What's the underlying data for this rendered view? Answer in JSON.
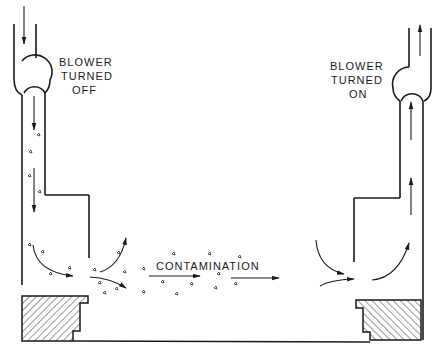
{
  "diagram": {
    "type": "airflow schematic",
    "labels": {
      "left_blower": [
        "BLOWER",
        "TURNED",
        "OFF"
      ],
      "right_blower": [
        "BLOWER",
        "TURNED",
        "ON"
      ],
      "flow": "CONTAMINATION"
    },
    "components": [
      {
        "name": "left-duct",
        "state": "blower off",
        "flow_direction": "down"
      },
      {
        "name": "right-duct",
        "state": "blower on",
        "flow_direction": "up"
      },
      {
        "name": "left-hatched-block"
      },
      {
        "name": "right-hatched-block"
      },
      {
        "name": "floor-line"
      }
    ],
    "colors": {
      "ink": "#1a1a1a",
      "background": "#ffffff"
    }
  }
}
